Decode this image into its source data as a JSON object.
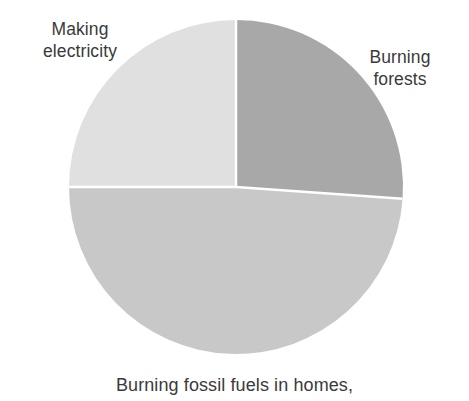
{
  "chart_data": {
    "type": "pie",
    "title": "",
    "subtitle": "",
    "xlabel": "",
    "ylabel": "",
    "legend_position": "none",
    "grid": false,
    "labels_placement": "outside-callout",
    "categories": [
      "Burning forests",
      "Burning fossil fuels in homes,",
      "Making electricity"
    ],
    "values": [
      26,
      49,
      25
    ],
    "units": "percent",
    "start_angle_deg": 0,
    "direction": "clockwise",
    "slices": [
      {
        "name": "burning-forests",
        "label": "Burning\nforests",
        "label_text": "Burning forests",
        "value": 26,
        "color": "#a8a8a8",
        "start_angle_deg": 0,
        "end_angle_deg": 94
      },
      {
        "name": "burning-fossil-fuels",
        "label": "Burning fossil fuels in homes,",
        "label_text": "Burning fossil fuels in homes,",
        "value": 49,
        "color": "#c8c8c8",
        "start_angle_deg": 94,
        "end_angle_deg": 270
      },
      {
        "name": "making-electricity",
        "label": "Making\nelectricity",
        "label_text": "Making electricity",
        "value": 25,
        "color": "#e0e0e0",
        "start_angle_deg": 270,
        "end_angle_deg": 360
      }
    ],
    "geometry": {
      "center_x": 236,
      "center_y": 187,
      "radius": 167
    },
    "style": {
      "background": "#ffffff",
      "separator_color": "#ffffff",
      "separator_width": 2.5,
      "text_color": "#3a3a3a"
    }
  },
  "labels": {
    "making_electricity": "Making\nelectricity",
    "burning_forests": "Burning\nforests",
    "burning_fossil_fuels": "Burning fossil fuels in homes,"
  }
}
